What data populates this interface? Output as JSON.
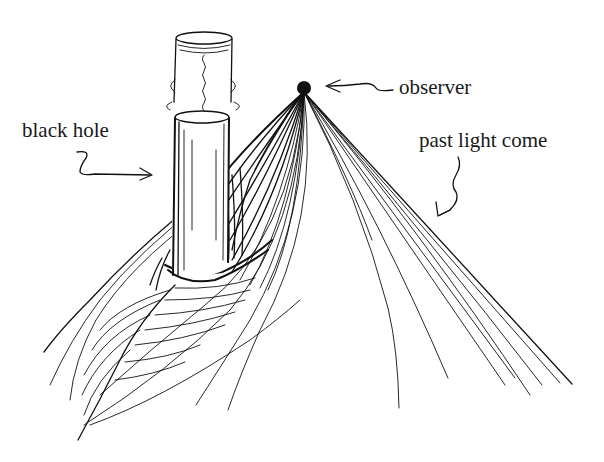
{
  "figure": {
    "labels": {
      "black_hole": "black hole",
      "observer": "observer",
      "past_light_cone": "past light come"
    },
    "elements": [
      {
        "id": "black-hole",
        "shape": "vertical cylinder",
        "label": "black hole"
      },
      {
        "id": "observer",
        "shape": "filled dot",
        "label": "observer"
      },
      {
        "id": "past-light-cone",
        "shape": "fan of null rays diverging downward",
        "label": "past light come"
      }
    ],
    "colors": {
      "ink": "#111111",
      "background": "#ffffff"
    }
  }
}
